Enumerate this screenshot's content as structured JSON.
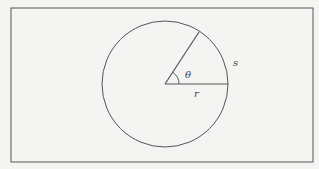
{
  "diagram": {
    "type": "circle-arc-angle",
    "frame": {
      "x": 11,
      "y": 8,
      "width": 302,
      "height": 154,
      "stroke": "#555555"
    },
    "circle": {
      "cx": 165,
      "cy": 84,
      "r": 63,
      "stroke": "#555555"
    },
    "radius_horizontal": {
      "x1": 165,
      "y1": 84,
      "x2": 228,
      "y2": 84
    },
    "radius_angled": {
      "x1": 165,
      "y1": 84,
      "x2": 199,
      "y2": 32
    },
    "angle_arc": {
      "r": 14
    },
    "labels": {
      "theta": "θ",
      "arc_length": "s",
      "radius": "r"
    },
    "colors": {
      "background": "#f4f4f2",
      "line": "#555555"
    }
  }
}
